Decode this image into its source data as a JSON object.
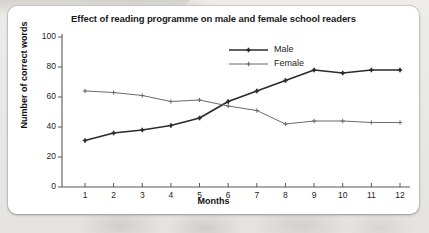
{
  "card": {
    "background_color": "#ffffff",
    "page_background_color": "#e9e8e4"
  },
  "chart_data": {
    "type": "line",
    "title": "Effect of reading programme on male and female school readers",
    "xlabel": "Months",
    "ylabel": "Number of correct words",
    "x": [
      1,
      2,
      3,
      4,
      5,
      6,
      7,
      8,
      9,
      10,
      11,
      12
    ],
    "categories": [
      "1",
      "2",
      "3",
      "4",
      "5",
      "6",
      "7",
      "8",
      "9",
      "10",
      "11",
      "12"
    ],
    "xtick_labels": [
      "1",
      "2",
      "3",
      "4",
      "5",
      "6",
      "7",
      "8",
      "9",
      "10",
      "11",
      "12"
    ],
    "ytick_labels": [
      "0",
      "20",
      "40",
      "60",
      "80",
      "100"
    ],
    "yticks": [
      0,
      20,
      40,
      60,
      80,
      100
    ],
    "ylim": [
      0,
      100
    ],
    "xlim": [
      0.5,
      12.5
    ],
    "grid": false,
    "legend_position": "upper-center",
    "series": [
      {
        "name": "Male",
        "color": "#2b2b2b",
        "line_width": 1.7,
        "marker": "plus",
        "values": [
          31,
          36,
          38,
          41,
          46,
          57,
          64,
          71,
          78,
          76,
          78,
          78
        ]
      },
      {
        "name": "Female",
        "color": "#6a6a6a",
        "line_width": 1.0,
        "marker": "plus",
        "values": [
          64,
          63,
          61,
          57,
          58,
          54,
          51,
          42,
          44,
          44,
          43,
          43
        ]
      }
    ]
  }
}
